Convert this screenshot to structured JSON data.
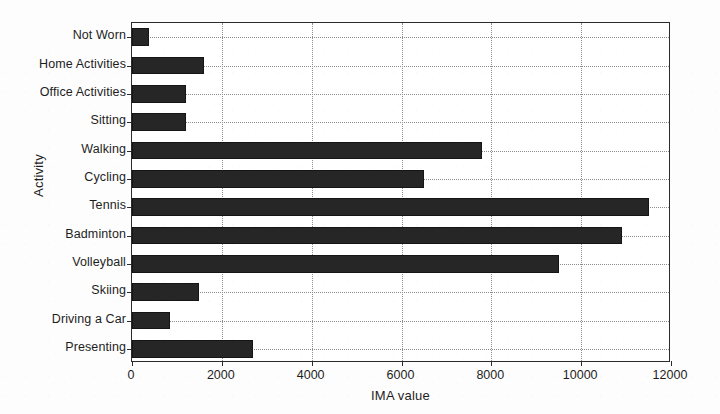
{
  "chart_data": {
    "type": "bar",
    "orientation": "horizontal",
    "title": "",
    "xlabel": "IMA value",
    "ylabel": "Activity",
    "xlim": [
      0,
      12000
    ],
    "xticks": [
      0,
      2000,
      4000,
      6000,
      8000,
      10000,
      12000
    ],
    "xtick_labels": [
      "0",
      "2000",
      "4000",
      "6000",
      "8000",
      "10000",
      "12000"
    ],
    "grid": "dotted",
    "legend": "none",
    "categories": [
      "Not Worn",
      "Home Activities",
      "Office Activities",
      "Sitting",
      "Walking",
      "Cycling",
      "Tennis",
      "Badminton",
      "Volleyball",
      "Skiing",
      "Driving a Car",
      "Presenting"
    ],
    "values": [
      380,
      1600,
      1200,
      1200,
      7800,
      6500,
      11500,
      10900,
      9500,
      1500,
      850,
      2700
    ],
    "bar_color": "#262626"
  },
  "figure": {
    "background": "#ffffff",
    "axis_color": "#2b2b2b",
    "grid_color": "#8d8d8d",
    "text_color": "#1d1d1d"
  }
}
